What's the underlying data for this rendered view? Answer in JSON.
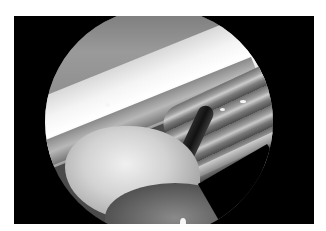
{
  "image": {
    "description": "Grayscale arthroscopic/endoscopic view with circular field of view on black background",
    "frame_color": "#000000",
    "page_background": "#ffffff",
    "colors": {
      "highlight": "#ffffff",
      "tissue_light": "#d8d8d8",
      "tissue_mid": "#8a8a8a",
      "tissue_dark": "#3a3a3a"
    }
  }
}
